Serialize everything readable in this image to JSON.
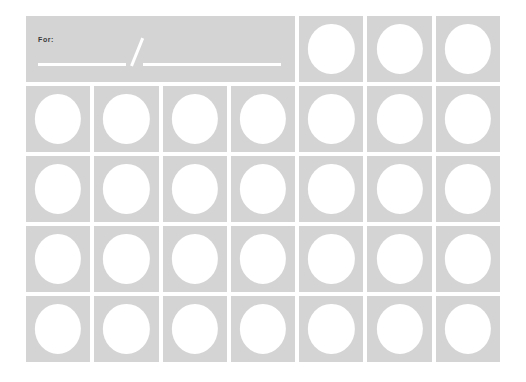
{
  "card": {
    "title": "blank-circle-grid-card",
    "background_color": "#ffffff",
    "cell_color": "#d4d4d4",
    "circle_color": "#ffffff",
    "columns": 7,
    "rows": 5
  },
  "header": {
    "label": "For:",
    "label_color": "#3a3a3a",
    "date_separator": "/",
    "blank_line_1_value": "",
    "blank_line_2_value": "",
    "blank_line_color": "#ffffff"
  },
  "header_circle_cells": [
    {
      "value": ""
    },
    {
      "value": ""
    },
    {
      "value": ""
    }
  ],
  "grid_rows": [
    {
      "cells": [
        {
          "value": ""
        },
        {
          "value": ""
        },
        {
          "value": ""
        },
        {
          "value": ""
        },
        {
          "value": ""
        },
        {
          "value": ""
        },
        {
          "value": ""
        }
      ]
    },
    {
      "cells": [
        {
          "value": ""
        },
        {
          "value": ""
        },
        {
          "value": ""
        },
        {
          "value": ""
        },
        {
          "value": ""
        },
        {
          "value": ""
        },
        {
          "value": ""
        }
      ]
    },
    {
      "cells": [
        {
          "value": ""
        },
        {
          "value": ""
        },
        {
          "value": ""
        },
        {
          "value": ""
        },
        {
          "value": ""
        },
        {
          "value": ""
        },
        {
          "value": ""
        }
      ]
    },
    {
      "cells": [
        {
          "value": ""
        },
        {
          "value": ""
        },
        {
          "value": ""
        },
        {
          "value": ""
        },
        {
          "value": ""
        },
        {
          "value": ""
        },
        {
          "value": ""
        }
      ]
    }
  ]
}
